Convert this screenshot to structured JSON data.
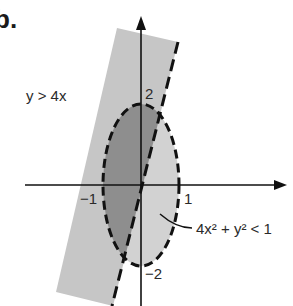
{
  "figure": {
    "part_label": "b.",
    "region_label_line": "y > 4x",
    "region_label_ellipse": "4x² + y² < 1",
    "ticks": {
      "x_neg": "−1",
      "x_pos": "1",
      "y_pos": "2",
      "y_neg": "−2"
    },
    "colors": {
      "band_fill": "#c9c9c9",
      "overlap_fill": "#8f8f8f",
      "ellipse_fill": "#d4d4d4",
      "stroke": "#111111"
    }
  }
}
